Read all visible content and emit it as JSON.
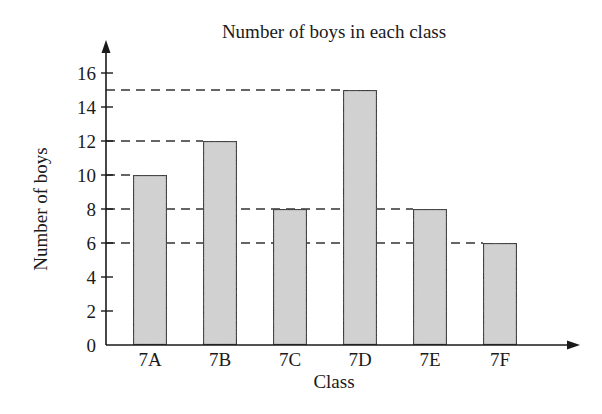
{
  "chart_data": {
    "type": "bar",
    "title": "Number of boys in each class",
    "xlabel": "Class",
    "ylabel": "Number of boys",
    "categories": [
      "7A",
      "7B",
      "7C",
      "7D",
      "7E",
      "7F"
    ],
    "values": [
      10,
      12,
      8,
      15,
      8,
      6
    ],
    "ylim": [
      0,
      16
    ],
    "yticks": [
      0,
      2,
      4,
      6,
      8,
      10,
      12,
      14,
      16
    ],
    "grid": false,
    "guide_lines": [
      {
        "value": 15,
        "to_category": "7D"
      },
      {
        "value": 12,
        "to_category": "7B"
      },
      {
        "value": 10,
        "to_category": "7A"
      },
      {
        "value": 8,
        "to_category": "7E"
      },
      {
        "value": 6,
        "to_category": "7F"
      }
    ],
    "legend": null,
    "colors": {
      "bar_fill": "#d4d4d4",
      "bar_stroke": "#1a1a1a",
      "axis": "#1a1a1a",
      "guide": "#333333"
    }
  }
}
